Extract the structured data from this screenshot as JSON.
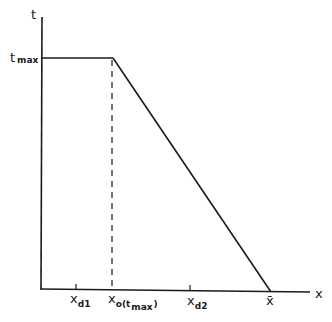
{
  "diagram": {
    "type": "piecewise-linear plot",
    "axes": {
      "y_label": "t",
      "x_label": "x"
    },
    "y_ticks": [
      {
        "main": "t",
        "sub": "max"
      }
    ],
    "x_ticks": [
      {
        "main": "x",
        "sub": "d1"
      },
      {
        "main": "x",
        "sub": "o(t",
        "sub2": "max",
        "close": ")"
      },
      {
        "main": "x",
        "sub": "d2"
      },
      {
        "main": "x̄"
      }
    ],
    "curve": {
      "description": "constant at t_max from 0 to x_o(t_max), then decreasing linearly to 0 at x-bar",
      "points": [
        [
          "0",
          "t_max"
        ],
        [
          "x_o(t_max)",
          "t_max"
        ],
        [
          "x-bar",
          "0"
        ]
      ]
    },
    "dashed_guide": "vertical dashed line from corner down to x_o(t_max)",
    "colors": {
      "ink": "#1a1a1a",
      "background": "#ffffff"
    }
  }
}
